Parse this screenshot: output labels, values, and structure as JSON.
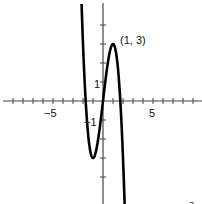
{
  "chart_data": {
    "type": "line",
    "title": "",
    "xlabel": "",
    "ylabel": "",
    "function": "y = -1.5x^3 + 4.5x",
    "xlim": [
      -10,
      10
    ],
    "ylim": [
      -5.4,
      5.3
    ],
    "grid": false,
    "legend": "none",
    "x_ticks": [
      -9,
      -8,
      -7,
      -6,
      -5,
      -4,
      -3,
      -2,
      -1,
      1,
      2,
      3,
      4,
      5,
      6,
      7,
      8,
      9
    ],
    "y_ticks": [
      -4,
      -3,
      -2,
      -1,
      1,
      2,
      3,
      4
    ],
    "tick_labels": {
      "x": [
        {
          "value": -5,
          "label": "−5"
        },
        {
          "value": 5,
          "label": "5"
        }
      ],
      "y": [
        {
          "value": 1,
          "label": "1"
        },
        {
          "value": -1,
          "label": "−1"
        }
      ]
    },
    "annotations": [
      {
        "x": 1,
        "y": 3,
        "text": "(1, 3)"
      }
    ],
    "key_points": [
      {
        "x": 1,
        "y": 3,
        "kind": "local max"
      },
      {
        "x": -1,
        "y": -3,
        "kind": "local min"
      },
      {
        "x": 0,
        "y": 0,
        "kind": "root"
      },
      {
        "x": -1.73,
        "y": 0,
        "kind": "root"
      },
      {
        "x": 1.73,
        "y": 0,
        "kind": "root"
      }
    ],
    "series": [
      {
        "name": "f(x)",
        "color": "#000000",
        "x": [
          -2.5,
          -2,
          -1.5,
          -1,
          -0.5,
          0,
          0.5,
          1,
          1.5,
          2,
          2.5
        ],
        "values": [
          12.19,
          3,
          -1.69,
          -3,
          -2.06,
          0,
          2.06,
          3,
          1.69,
          -3,
          -12.19
        ]
      }
    ]
  },
  "labels": {
    "annotation": "(1, 3)",
    "x_neg5": "−5",
    "x_pos5": "5",
    "y_pos1": "1",
    "y_neg1": "−1",
    "cropped_top_text": "(page …)",
    "corner_mark": "3"
  },
  "style": {
    "axis_color": "#444444",
    "curve_color": "#000000",
    "background": "#ffffff"
  }
}
